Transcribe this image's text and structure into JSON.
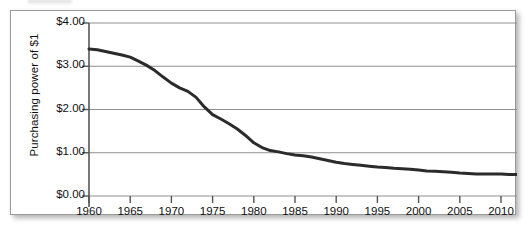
{
  "chart_data": {
    "type": "line",
    "title": "",
    "subtitle": "",
    "xlabel": "",
    "ylabel": "Purchasing power of $1",
    "xlim": [
      1960,
      2012
    ],
    "ylim": [
      0.0,
      4.0
    ],
    "grid": true,
    "legend": false,
    "x_tick_labels": [
      "1960",
      "1965",
      "1970",
      "1975",
      "1980",
      "1985",
      "1990",
      "1995",
      "2000",
      "2005",
      "2010"
    ],
    "x_ticks": [
      1960,
      1965,
      1970,
      1975,
      1980,
      1985,
      1990,
      1995,
      2000,
      2005,
      2010
    ],
    "y_tick_labels": [
      "$0.00",
      "$1.00",
      "$2.00",
      "$3.00",
      "$4.00"
    ],
    "y_ticks": [
      0,
      1,
      2,
      3,
      4
    ],
    "line_color": "#2b2b2b",
    "line_width": 3,
    "series": [
      {
        "name": "Purchasing power of $1",
        "x": [
          1960,
          1961,
          1962,
          1963,
          1964,
          1965,
          1966,
          1967,
          1968,
          1969,
          1970,
          1971,
          1972,
          1973,
          1974,
          1975,
          1976,
          1977,
          1978,
          1979,
          1980,
          1981,
          1982,
          1983,
          1984,
          1985,
          1986,
          1987,
          1988,
          1989,
          1990,
          1991,
          1992,
          1993,
          1994,
          1995,
          1996,
          1997,
          1998,
          1999,
          2000,
          2001,
          2002,
          2003,
          2004,
          2005,
          2006,
          2007,
          2008,
          2009,
          2010,
          2011,
          2012
        ],
        "values": [
          3.4,
          3.38,
          3.34,
          3.3,
          3.26,
          3.21,
          3.12,
          3.02,
          2.9,
          2.75,
          2.61,
          2.5,
          2.42,
          2.28,
          2.06,
          1.88,
          1.78,
          1.67,
          1.55,
          1.4,
          1.23,
          1.12,
          1.05,
          1.02,
          0.98,
          0.95,
          0.93,
          0.9,
          0.86,
          0.82,
          0.78,
          0.75,
          0.73,
          0.71,
          0.69,
          0.67,
          0.66,
          0.64,
          0.63,
          0.62,
          0.6,
          0.58,
          0.57,
          0.56,
          0.55,
          0.53,
          0.52,
          0.51,
          0.51,
          0.51,
          0.51,
          0.5,
          0.5
        ]
      }
    ]
  },
  "figure": {
    "y_axis_title": "Purchasing power of $1",
    "axis_color": "#4a4a4a",
    "grid_color": "#8f8f8f",
    "frame_color": "#9a9a9a",
    "background": "#ffffff"
  }
}
